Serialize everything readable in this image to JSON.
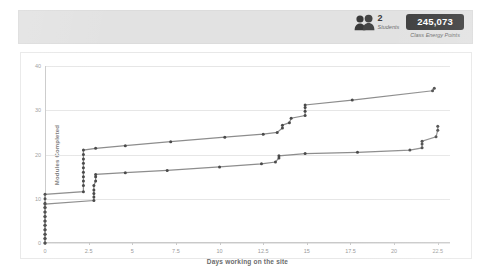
{
  "header": {
    "students": {
      "count": "2",
      "label": "Students",
      "icon": "people-icon"
    },
    "energy": {
      "value": "245,073",
      "label": "Class Energy Points"
    }
  },
  "colors": {
    "band_background": "#e2e2e2",
    "pill_background": "#3e3e3e",
    "pill_text": "#ffffff",
    "line": "#8d8d8d",
    "marker": "#4a4a4a",
    "gridline": "#e6e6e6",
    "panel_background": "#ffffff"
  },
  "chart_data": {
    "type": "line",
    "title": "",
    "xlabel": "Days working on the site",
    "ylabel": "Modules Completed",
    "xlim": [
      0,
      23.2
    ],
    "ylim": [
      0,
      40
    ],
    "xticks": [
      0,
      2.5,
      5,
      7.5,
      10,
      12.5,
      15,
      17.5,
      20,
      22.5
    ],
    "xtick_labels": [
      "0",
      "2.5",
      "5",
      "7.5",
      "10",
      "12.5",
      "15",
      "17.5",
      "20",
      "22.5"
    ],
    "yticks": [
      0,
      10,
      20,
      30,
      40
    ],
    "ytick_labels": [
      "0",
      "10",
      "20",
      "30",
      "40"
    ],
    "grid": true,
    "legend": "none",
    "series": [
      {
        "name": "Student 1",
        "points": [
          [
            0.0,
            0.0
          ],
          [
            0.0,
            1.0
          ],
          [
            0.0,
            2.0
          ],
          [
            0.0,
            3.0
          ],
          [
            0.0,
            4.0
          ],
          [
            0.0,
            5.0
          ],
          [
            0.0,
            6.0
          ],
          [
            0.0,
            7.0
          ],
          [
            0.0,
            8.0
          ],
          [
            0.0,
            9.0
          ],
          [
            0.0,
            10.0
          ],
          [
            0.0,
            11.0
          ],
          [
            2.2,
            11.6
          ],
          [
            2.2,
            13.0
          ],
          [
            2.2,
            14.0
          ],
          [
            2.2,
            15.0
          ],
          [
            2.2,
            16.0
          ],
          [
            2.2,
            17.0
          ],
          [
            2.2,
            18.0
          ],
          [
            2.2,
            19.0
          ],
          [
            2.2,
            20.0
          ],
          [
            2.2,
            21.0
          ],
          [
            2.9,
            21.4
          ],
          [
            4.6,
            22.0
          ],
          [
            7.2,
            22.9
          ],
          [
            10.3,
            23.9
          ],
          [
            12.5,
            24.6
          ],
          [
            13.3,
            25.0
          ],
          [
            13.6,
            26.0
          ],
          [
            13.6,
            26.6
          ],
          [
            14.0,
            27.2
          ],
          [
            14.1,
            28.2
          ],
          [
            14.9,
            28.8
          ],
          [
            14.9,
            29.8
          ],
          [
            14.9,
            30.6
          ],
          [
            14.9,
            31.2
          ],
          [
            17.6,
            32.3
          ],
          [
            22.2,
            34.4
          ],
          [
            22.3,
            35.0
          ]
        ]
      },
      {
        "name": "Student 2",
        "points": [
          [
            0.0,
            0.0
          ],
          [
            0.0,
            1.0
          ],
          [
            0.0,
            2.0
          ],
          [
            0.0,
            3.0
          ],
          [
            0.0,
            4.0
          ],
          [
            0.0,
            5.0
          ],
          [
            0.0,
            6.0
          ],
          [
            0.0,
            7.0
          ],
          [
            0.0,
            8.0
          ],
          [
            0.0,
            8.8
          ],
          [
            2.8,
            9.6
          ],
          [
            2.8,
            10.4
          ],
          [
            2.8,
            11.2
          ],
          [
            2.8,
            12.0
          ],
          [
            2.8,
            13.0
          ],
          [
            2.9,
            14.0
          ],
          [
            2.9,
            15.0
          ],
          [
            2.9,
            15.5
          ],
          [
            4.6,
            15.9
          ],
          [
            7.0,
            16.4
          ],
          [
            10.0,
            17.2
          ],
          [
            12.4,
            17.9
          ],
          [
            13.2,
            18.3
          ],
          [
            13.4,
            19.2
          ],
          [
            13.4,
            19.7
          ],
          [
            14.9,
            20.2
          ],
          [
            17.9,
            20.5
          ],
          [
            20.9,
            21.0
          ],
          [
            21.6,
            21.5
          ],
          [
            21.6,
            22.4
          ],
          [
            21.6,
            23.0
          ],
          [
            22.4,
            24.0
          ],
          [
            22.5,
            25.5
          ],
          [
            22.5,
            26.4
          ]
        ]
      }
    ]
  }
}
